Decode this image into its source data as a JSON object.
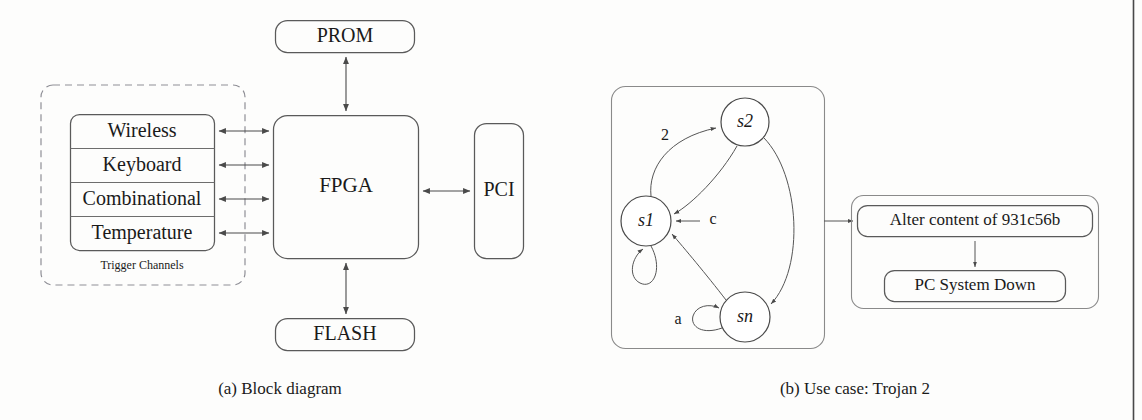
{
  "figure": {
    "panels": [
      {
        "id": "a",
        "caption": "(a)  Block diagram",
        "type": "block-diagram"
      },
      {
        "id": "b",
        "caption": "(b)  Use case: Trojan 2",
        "type": "state-machine"
      }
    ]
  },
  "block_diagram": {
    "trigger_group": {
      "label": "Trigger Channels",
      "channels": [
        {
          "name": "Wireless"
        },
        {
          "name": "Keyboard"
        },
        {
          "name": "Combinational"
        },
        {
          "name": "Temperature"
        }
      ]
    },
    "core": {
      "label": "FPGA"
    },
    "peripherals": [
      {
        "id": "prom",
        "label": "PROM",
        "position": "top"
      },
      {
        "id": "flash",
        "label": "FLASH",
        "position": "bottom"
      },
      {
        "id": "pci",
        "label": "PCI",
        "position": "right"
      }
    ],
    "connections": [
      {
        "from": "Wireless",
        "to": "FPGA",
        "kind": "bidirectional"
      },
      {
        "from": "Keyboard",
        "to": "FPGA",
        "kind": "bidirectional"
      },
      {
        "from": "Combinational",
        "to": "FPGA",
        "kind": "bidirectional"
      },
      {
        "from": "Temperature",
        "to": "FPGA",
        "kind": "bidirectional"
      },
      {
        "from": "FPGA",
        "to": "PROM",
        "kind": "bidirectional"
      },
      {
        "from": "FPGA",
        "to": "FLASH",
        "kind": "bidirectional"
      },
      {
        "from": "FPGA",
        "to": "PCI",
        "kind": "bidirectional"
      }
    ]
  },
  "state_machine": {
    "states": [
      {
        "id": "s1",
        "label": "s1"
      },
      {
        "id": "s2",
        "label": "s2"
      },
      {
        "id": "sn",
        "label": "sn"
      }
    ],
    "transitions": [
      {
        "from": "s1",
        "to": "s2",
        "label": "2"
      },
      {
        "from": "s2",
        "to": "s1",
        "label": "c"
      },
      {
        "from": "s2",
        "to": "sn",
        "label": ""
      },
      {
        "from": "sn",
        "to": "s1",
        "label": ""
      },
      {
        "from": "s1",
        "to": "s1",
        "label": "",
        "kind": "self-loop"
      },
      {
        "from": "sn",
        "to": "sn",
        "label": "a",
        "kind": "self-loop"
      }
    ],
    "labels": {
      "transition_2": "2",
      "transition_c": "c",
      "transition_a": "a"
    },
    "payload": {
      "steps": [
        {
          "id": "alter",
          "label": "Alter content of 931c56b"
        },
        {
          "id": "down",
          "label": "PC System Down"
        }
      ]
    }
  },
  "colors": {
    "ink": "#1a1a1a",
    "stroke": "#4a4a4a",
    "soft_stroke": "#8a8a8a",
    "dashed_stroke": "#8f8f96",
    "background": "#fdfdfc",
    "page_edge": "#2a2a2a"
  }
}
